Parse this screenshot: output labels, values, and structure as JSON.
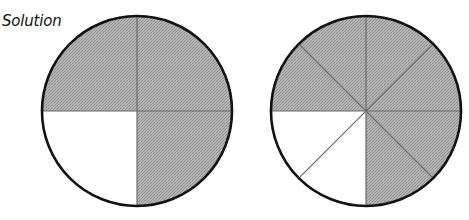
{
  "title": "Solution",
  "colors": {
    "shaded": "#a8a8a8",
    "unshaded": "#ffffff",
    "outline": "#111111",
    "divider": "#6a6a6a"
  },
  "figures": [
    {
      "name": "quarters-circle",
      "parts": 4,
      "shaded_parts": 3,
      "fraction": "3/4",
      "unshaded_region": "bottom-left quarter"
    },
    {
      "name": "eighths-circle",
      "parts": 8,
      "shaded_parts": 6,
      "fraction": "6/8",
      "unshaded_region": "two bottom-left eighths"
    }
  ]
}
